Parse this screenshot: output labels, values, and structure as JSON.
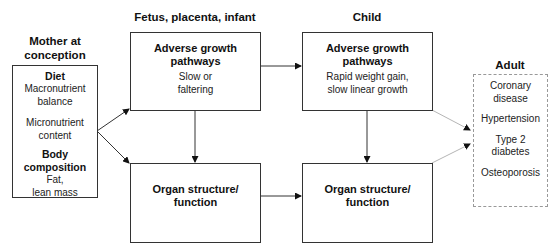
{
  "stages": {
    "mother": {
      "heading": "Mother at conception",
      "heading_line1": "Mother at",
      "heading_line2": "conception",
      "diet_label": "Diet",
      "diet_items": [
        "Macronutrient balance",
        "Micronutrient content"
      ],
      "diet_item1_line1": "Macronutrient",
      "diet_item1_line2": "balance",
      "diet_item2_line1": "Micronutrient",
      "diet_item2_line2": "content",
      "body_label": "Body composition",
      "body_line1": "Fat,",
      "body_line2": "lean mass"
    },
    "fetus": {
      "heading": "Fetus, placenta, infant",
      "growth_title_line1": "Adverse growth",
      "growth_title_line2": "pathways",
      "growth_desc_line1": "Slow or",
      "growth_desc_line2": "faltering",
      "organ_line1": "Organ structure/",
      "organ_line2": "function"
    },
    "child": {
      "heading": "Child",
      "growth_title_line1": "Adverse growth",
      "growth_title_line2": "pathways",
      "growth_desc_line1": "Rapid weight gain,",
      "growth_desc_line2": "slow linear growth",
      "organ_line1": "Organ structure/",
      "organ_line2": "function"
    },
    "adult": {
      "heading": "Adult",
      "outcomes": [
        {
          "line1": "Coronary",
          "line2": "disease"
        },
        {
          "line1": "Hypertension",
          "line2": ""
        },
        {
          "line1": "Type 2",
          "line2": "diabetes"
        },
        {
          "line1": "Osteoporosis",
          "line2": ""
        }
      ]
    }
  },
  "edges": [
    {
      "from": "mother",
      "to": "fetus-growth"
    },
    {
      "from": "mother",
      "to": "fetus-organ"
    },
    {
      "from": "fetus-growth",
      "to": "fetus-organ"
    },
    {
      "from": "fetus-growth",
      "to": "child-growth"
    },
    {
      "from": "fetus-organ",
      "to": "child-organ"
    },
    {
      "from": "child-growth",
      "to": "child-organ"
    },
    {
      "from": "child-growth",
      "to": "adult"
    },
    {
      "from": "child-organ",
      "to": "adult"
    }
  ],
  "colors": {
    "solid_line": "#222222",
    "faint_line": "#b5b5b5",
    "dashed_border": "#999999"
  }
}
